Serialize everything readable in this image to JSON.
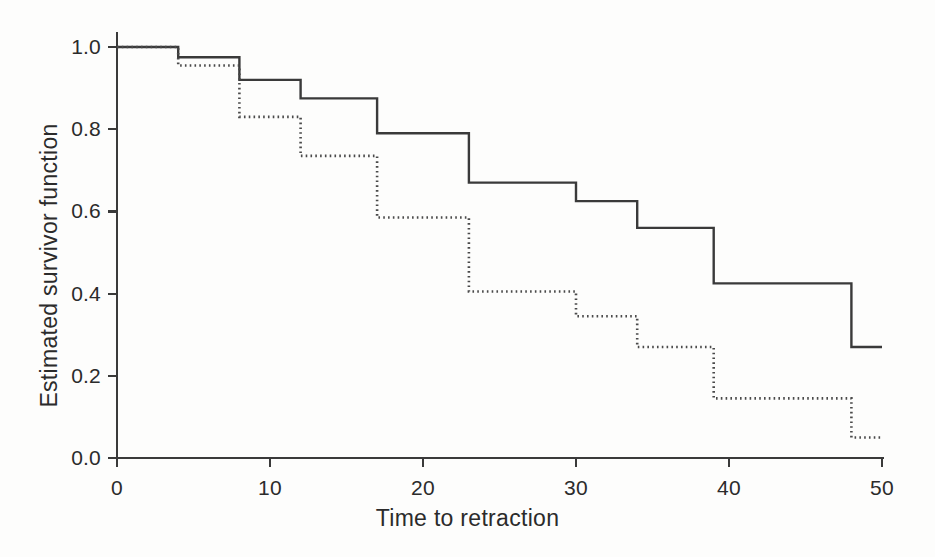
{
  "chart_data": {
    "type": "line",
    "title": "",
    "subtitle": "",
    "xlabel": "Time to retraction",
    "ylabel": "Estimated survivor function",
    "xlim": [
      0,
      50
    ],
    "ylim": [
      0.0,
      1.0
    ],
    "xticks": [
      0,
      10,
      20,
      30,
      40,
      50
    ],
    "xtick_labels": [
      "0",
      "10",
      "20",
      "30",
      "40",
      "50"
    ],
    "yticks": [
      0.0,
      0.2,
      0.4,
      0.6,
      0.8,
      1.0
    ],
    "ytick_labels": [
      "0.0",
      "0.2",
      "0.4",
      "0.6",
      "0.8",
      "1.0"
    ],
    "grid": false,
    "legend": "none",
    "step_style": "post",
    "series": [
      {
        "name": "solid-curve",
        "style": "solid",
        "color": "#3a3a3a",
        "x": [
          0,
          4,
          8,
          12,
          17,
          23,
          30,
          34,
          39,
          48,
          50
        ],
        "values": [
          1.0,
          0.975,
          0.92,
          0.875,
          0.79,
          0.67,
          0.625,
          0.56,
          0.425,
          0.27,
          0.27
        ]
      },
      {
        "name": "dotted-curve",
        "style": "dotted",
        "color": "#4a4a4a",
        "x": [
          0,
          4,
          8,
          12,
          17,
          23,
          30,
          34,
          39,
          48,
          50
        ],
        "values": [
          1.0,
          0.955,
          0.83,
          0.735,
          0.585,
          0.405,
          0.345,
          0.27,
          0.145,
          0.05,
          0.05
        ]
      }
    ]
  },
  "axes": {
    "x_title": "Time to retraction",
    "y_title": "Estimated survivor function",
    "x_tick_labels": [
      "0",
      "10",
      "20",
      "30",
      "40",
      "50"
    ],
    "y_tick_labels": [
      "0.0",
      "0.2",
      "0.4",
      "0.6",
      "0.8",
      "1.0"
    ],
    "axis_color": "#3a3a3a"
  },
  "colors": {
    "background": "#fdfdfc",
    "axis": "#3a3a3a",
    "solid_line": "#3a3a3a",
    "dotted_line": "#4a4a4a"
  }
}
